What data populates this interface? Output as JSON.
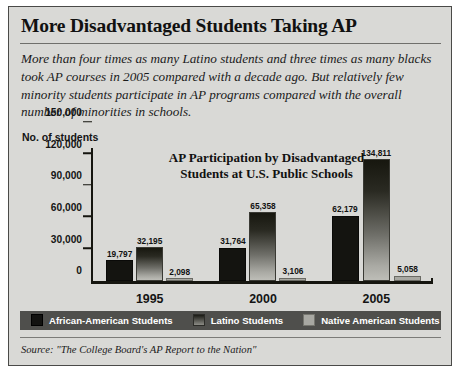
{
  "headline": "More Disadvantaged Students Taking AP",
  "deck": "More than four times as many Latino students and three times as many blacks took AP courses in 2005 compared with a decade ago. But relatively few minority students participate in AP programs compared with the overall number of minorities in schools.",
  "axis_caption": "No. of students",
  "source": "Source: \"The College Board's AP Report to the Nation\"",
  "colors": {
    "panel_background": "#d9d9d6",
    "panel_border": "#4a4a48",
    "legend_background": "#4f4f4c",
    "series_african_american": "#141410",
    "series_latino_top": "#17170f",
    "series_latino_bottom": "#bdbdb7",
    "series_native_american": "#a8a8a2",
    "axis": "#15150f",
    "text": "#111111"
  },
  "chart_data": {
    "type": "bar",
    "title": "AP Participation by Disadvantaged Students at U.S. Public Schools",
    "title_line1": "AP Participation by Disadvantaged",
    "title_line2": "Students at U.S. Public Schools",
    "xlabel": "",
    "ylabel": "No. of students",
    "ylim": [
      0,
      150000
    ],
    "yticks": [
      0,
      30000,
      60000,
      90000,
      120000,
      150000
    ],
    "ytick_labels": [
      "0",
      "30,000",
      "60,000",
      "90,000",
      "120,000",
      "150,000"
    ],
    "categories": [
      "1995",
      "2000",
      "2005"
    ],
    "grid": false,
    "legend_position": "bottom",
    "series": [
      {
        "name": "African-American Students",
        "values": [
          19797,
          31764,
          62179
        ],
        "value_labels": [
          "19,797",
          "31,764",
          "62,179"
        ]
      },
      {
        "name": "Latino Students",
        "values": [
          32195,
          65358,
          134811
        ],
        "value_labels": [
          "32,195",
          "65,358",
          "134,811"
        ]
      },
      {
        "name": "Native American Students",
        "values": [
          2098,
          3106,
          5058
        ],
        "value_labels": [
          "2,098",
          "3,106",
          "5,058"
        ]
      }
    ]
  }
}
